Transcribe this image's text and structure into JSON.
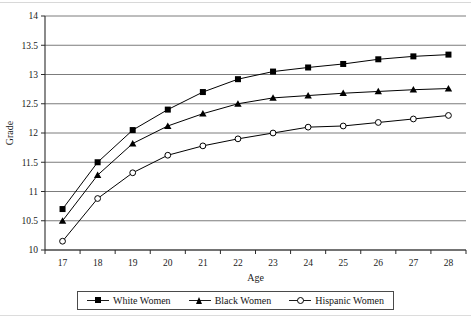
{
  "chart_data": {
    "type": "line",
    "title": "",
    "xlabel": "Age",
    "ylabel": "Grade",
    "categories": [
      17,
      18,
      19,
      20,
      21,
      22,
      23,
      24,
      25,
      26,
      27,
      28
    ],
    "xlim": [
      17,
      28
    ],
    "ylim": [
      10,
      14
    ],
    "yticks": [
      10,
      10.5,
      11,
      11.5,
      12,
      12.5,
      13,
      13.5,
      14
    ],
    "ytick_labels": [
      "10",
      "10.5",
      "11",
      "11.5",
      "12",
      "12.5",
      "13",
      "13.5",
      "14"
    ],
    "xtick_labels": [
      "17",
      "18",
      "19",
      "20",
      "21",
      "22",
      "23",
      "24",
      "25",
      "26",
      "27",
      "28"
    ],
    "grid": "horizontal",
    "legend_position": "bottom",
    "series": [
      {
        "name": "White Women",
        "marker": "filled-square",
        "color": "#000000",
        "values": [
          10.7,
          11.5,
          12.05,
          12.4,
          12.7,
          12.92,
          13.05,
          13.12,
          13.18,
          13.26,
          13.31,
          13.34
        ]
      },
      {
        "name": "Black Women",
        "marker": "filled-triangle",
        "color": "#000000",
        "values": [
          10.5,
          11.28,
          11.82,
          12.12,
          12.33,
          12.5,
          12.6,
          12.64,
          12.68,
          12.71,
          12.74,
          12.76
        ]
      },
      {
        "name": "Hispanic Women",
        "marker": "open-circle",
        "color": "#000000",
        "values": [
          10.15,
          10.88,
          11.32,
          11.62,
          11.78,
          11.9,
          12.0,
          12.1,
          12.12,
          12.18,
          12.24,
          12.3
        ]
      }
    ]
  },
  "legend": {
    "items": [
      {
        "label": "White Women",
        "marker": "filled-square"
      },
      {
        "label": "Black Women",
        "marker": "filled-triangle"
      },
      {
        "label": "Hispanic Women",
        "marker": "open-circle"
      }
    ]
  },
  "axes": {
    "y_title": "Grade",
    "x_title": "Age"
  }
}
